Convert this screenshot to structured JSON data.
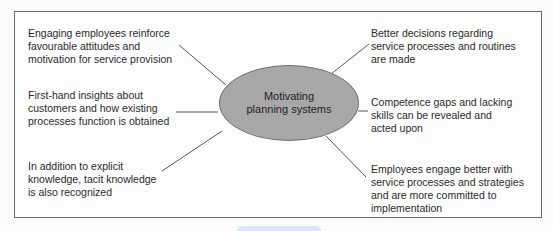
{
  "diagram": {
    "center": {
      "label": "Motivating planning systems",
      "line1": "Motivating",
      "line2": "planning systems",
      "fill": "#a8a8a8"
    },
    "nodes": {
      "top_left": "Engaging employees reinforce\nfavourable attitudes and\nmotivation for service provision",
      "middle_left": "First-hand insights about\ncustomers and how existing\nprocesses function is obtained",
      "bottom_left": "In addition to explicit\nknowledge, tacit knowledge\nis also recognized",
      "top_right": "Better decisions regarding\nservice processes and routines\nare made",
      "middle_right": "Competence gaps and lacking\nskills can be revealed and\nacted upon",
      "bottom_right": "Employees engage better with\nservice processes and strategies\nand are more committed to\nimplementation"
    },
    "colors": {
      "frame_border": "#6a6a6a",
      "connector": "#555555",
      "bottom_tab": "#dde6f7"
    }
  }
}
